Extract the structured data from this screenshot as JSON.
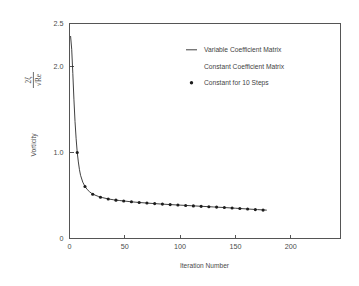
{
  "chart_data": {
    "type": "line",
    "title": "",
    "xlabel": "Iteration Number",
    "ylabel_top": "2ζ",
    "ylabel_bottom": "√Re",
    "ylabel_secondary": "Vorticity",
    "xlim": [
      0,
      245
    ],
    "ylim": [
      0,
      2.5
    ],
    "grid": false,
    "xticks": [
      0,
      50,
      100,
      150,
      200
    ],
    "xticklabels": [
      "0",
      "50",
      "100",
      "150",
      "200"
    ],
    "yticks": [
      0,
      1.0,
      2.0,
      2.5
    ],
    "yticklabels": [
      "0",
      "1.0",
      "2.0",
      "2.5"
    ],
    "legend_position": "upper right",
    "legend": [
      {
        "label": "Variable Coefficient Matrix",
        "marker": "line"
      },
      {
        "label": "Constant Coefficient Matrix",
        "marker": "none"
      },
      {
        "label": "Constant for 10 Steps",
        "marker": "circle"
      }
    ],
    "series": [
      {
        "name": "Variable Coefficient Matrix",
        "style": "line",
        "x": [
          1,
          2,
          3,
          4,
          5,
          6,
          7,
          8,
          9,
          10,
          12,
          14,
          16,
          18,
          20,
          23,
          26,
          30,
          35,
          40,
          45,
          50,
          55,
          60,
          70,
          80,
          90,
          100,
          110,
          120,
          130,
          140,
          150,
          160,
          170,
          178
        ],
        "y": [
          2.35,
          2.2,
          1.92,
          1.62,
          1.36,
          1.16,
          1.0,
          0.89,
          0.8,
          0.735,
          0.655,
          0.605,
          0.57,
          0.545,
          0.525,
          0.505,
          0.49,
          0.475,
          0.46,
          0.45,
          0.442,
          0.435,
          0.428,
          0.422,
          0.412,
          0.403,
          0.395,
          0.388,
          0.381,
          0.374,
          0.367,
          0.36,
          0.352,
          0.344,
          0.336,
          0.33
        ]
      },
      {
        "name": "Constant for 10 Steps",
        "style": "markers",
        "x": [
          7,
          14,
          21,
          28,
          35,
          42,
          49,
          56,
          63,
          70,
          77,
          84,
          91,
          98,
          105,
          112,
          119,
          126,
          133,
          140,
          147,
          154,
          161,
          168,
          175
        ],
        "y": [
          1.0,
          0.605,
          0.515,
          0.48,
          0.46,
          0.446,
          0.436,
          0.427,
          0.419,
          0.412,
          0.406,
          0.4,
          0.394,
          0.389,
          0.384,
          0.379,
          0.374,
          0.37,
          0.365,
          0.36,
          0.355,
          0.349,
          0.343,
          0.336,
          0.33
        ]
      }
    ]
  }
}
